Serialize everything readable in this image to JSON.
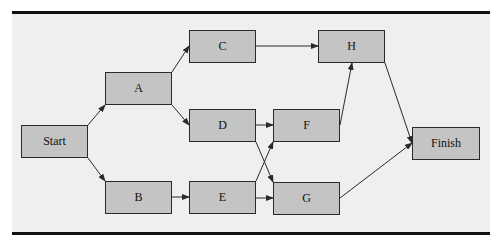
{
  "diagram": {
    "type": "activity-on-node network",
    "nodes": [
      {
        "id": "start",
        "label": "Start"
      },
      {
        "id": "a",
        "label": "A"
      },
      {
        "id": "b",
        "label": "B"
      },
      {
        "id": "c",
        "label": "C"
      },
      {
        "id": "d",
        "label": "D"
      },
      {
        "id": "e",
        "label": "E"
      },
      {
        "id": "f",
        "label": "F"
      },
      {
        "id": "g",
        "label": "G"
      },
      {
        "id": "h",
        "label": "H"
      },
      {
        "id": "finish",
        "label": "Finish"
      }
    ],
    "edges": [
      {
        "from": "start",
        "to": "a"
      },
      {
        "from": "start",
        "to": "b"
      },
      {
        "from": "a",
        "to": "c"
      },
      {
        "from": "a",
        "to": "d"
      },
      {
        "from": "b",
        "to": "e"
      },
      {
        "from": "c",
        "to": "h"
      },
      {
        "from": "d",
        "to": "f"
      },
      {
        "from": "d",
        "to": "g"
      },
      {
        "from": "e",
        "to": "f"
      },
      {
        "from": "e",
        "to": "g"
      },
      {
        "from": "f",
        "to": "h"
      },
      {
        "from": "h",
        "to": "finish"
      },
      {
        "from": "g",
        "to": "finish"
      }
    ]
  }
}
